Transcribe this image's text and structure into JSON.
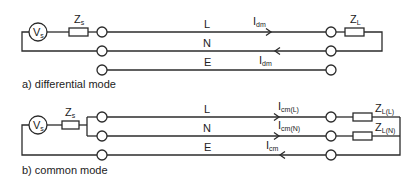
{
  "diagram_a": {
    "caption": "a) differential mode",
    "source": {
      "label": "V",
      "sub": "s"
    },
    "source_impedance": {
      "label": "Z",
      "sub": "s"
    },
    "load_impedance": {
      "label": "Z",
      "sub": "L"
    },
    "conductors": [
      {
        "name": "L"
      },
      {
        "name": "N"
      },
      {
        "name": "E"
      }
    ],
    "currents": [
      {
        "label": "I",
        "sub": "dm",
        "direction": "right",
        "conductor": "L"
      },
      {
        "label": "I",
        "sub": "dm",
        "direction": "left",
        "conductor": "N"
      }
    ]
  },
  "diagram_b": {
    "caption": "b) common mode",
    "source": {
      "label": "V",
      "sub": "s"
    },
    "source_impedance": {
      "label": "Z",
      "sub": "s"
    },
    "load_impedances": [
      {
        "label": "Z",
        "sub": "L(L)"
      },
      {
        "label": "Z",
        "sub": "L(N)"
      }
    ],
    "conductors": [
      {
        "name": "L"
      },
      {
        "name": "N"
      },
      {
        "name": "E"
      }
    ],
    "currents": [
      {
        "label": "I",
        "sub": "cm(L)",
        "direction": "right",
        "conductor": "L"
      },
      {
        "label": "I",
        "sub": "cm(N)",
        "direction": "right",
        "conductor": "N"
      },
      {
        "label": "I",
        "sub": "cm",
        "direction": "left",
        "conductor": "E"
      }
    ]
  }
}
